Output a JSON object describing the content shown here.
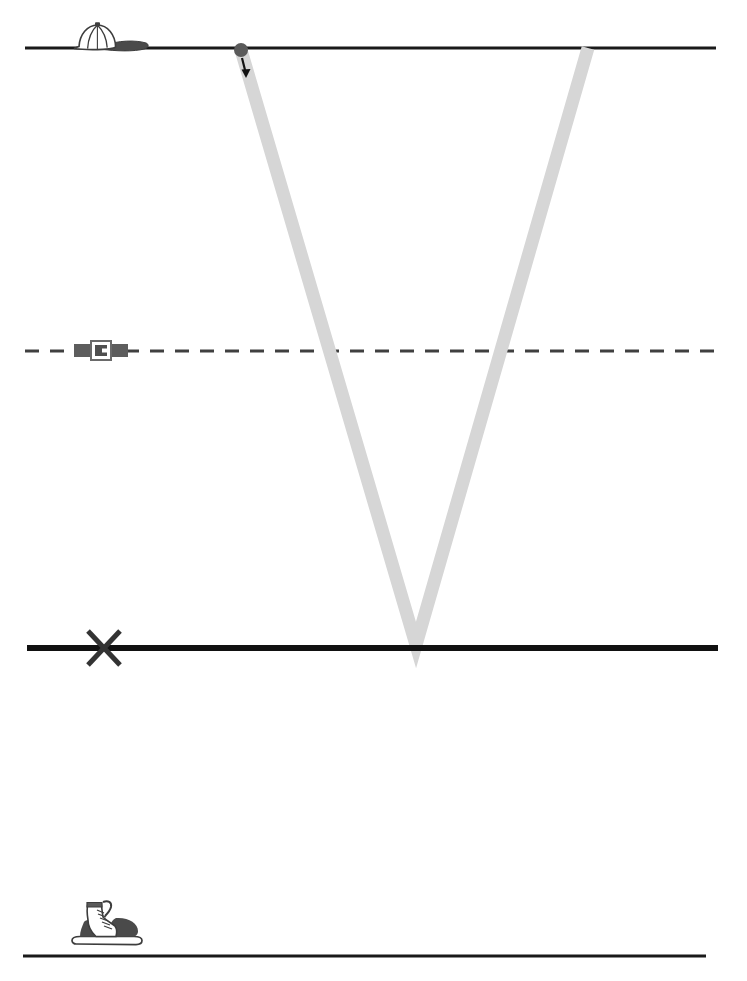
{
  "diagram": {
    "title": "Ball trajectory relative to body-height reference lines",
    "background_color": "#ffffff",
    "width": 747,
    "height": 981,
    "reference_lines": [
      {
        "id": "cap-line",
        "name": "head-height-line",
        "label": "Head height line",
        "style": "solid",
        "color": "#1a1a1a",
        "thickness": 3,
        "y": 48,
        "x_start": 25,
        "x_end": 716,
        "marker_icon": "baseball-cap-icon",
        "marker_label": "Baseball cap"
      },
      {
        "id": "belt-line",
        "name": "waist-height-line",
        "label": "Waist height line",
        "style": "dashed",
        "color": "#404040",
        "thickness": 3,
        "dash_pattern": "14 11",
        "y": 351,
        "x_start": 25,
        "x_end": 716,
        "marker_icon": "belt-buckle-icon",
        "marker_label": "Belt with buckle"
      },
      {
        "id": "ground-line",
        "name": "ground-level-line",
        "label": "Ground level line",
        "style": "solid-thick",
        "color": "#111111",
        "thickness": 6,
        "y": 648,
        "x_start": 27,
        "x_end": 718,
        "marker_icon": "x-cross-icon",
        "marker_label": "X cross mark"
      },
      {
        "id": "boot-line",
        "name": "floor-baseline-line",
        "label": "Floor baseline",
        "style": "solid",
        "color": "#1a1a1a",
        "thickness": 3,
        "y": 956,
        "x_start": 23,
        "x_end": 706,
        "marker_icon": "hiking-boot-icon",
        "marker_label": "Hiking boot"
      }
    ],
    "trajectory": {
      "name": "ball-path",
      "label": "Ball trajectory (V path)",
      "color": "#d6d6d6",
      "stroke_width": 13,
      "points": [
        {
          "x": 241,
          "y": 50,
          "label": "release point"
        },
        {
          "x": 416,
          "y": 645,
          "label": "bounce / lowest point"
        },
        {
          "x": 588,
          "y": 48,
          "label": "end point"
        }
      ]
    },
    "ball": {
      "name": "ball-marker",
      "label": "Ball",
      "color": "#5a5a5a",
      "x": 241,
      "y": 50,
      "radius": 7
    },
    "direction_arrow": {
      "name": "direction-arrow",
      "label": "Downward motion arrow",
      "color": "#111111",
      "x1": 243,
      "y1": 56,
      "x2": 246,
      "y2": 76
    },
    "icons": {
      "cap": {
        "name": "baseball-cap-icon",
        "x": 72,
        "y": 24,
        "width": 72,
        "height": 28,
        "fill": "#4a4a4a"
      },
      "belt": {
        "name": "belt-buckle-icon",
        "x": 76,
        "y": 341,
        "width": 52,
        "height": 19,
        "fill": "#585858"
      },
      "cross": {
        "name": "x-cross-icon",
        "x": 86,
        "y": 630,
        "size": 36,
        "color": "#333333"
      },
      "boot": {
        "name": "hiking-boot-icon",
        "x": 72,
        "y": 900,
        "width": 78,
        "height": 58,
        "fill": "#4a4a4a"
      }
    }
  }
}
